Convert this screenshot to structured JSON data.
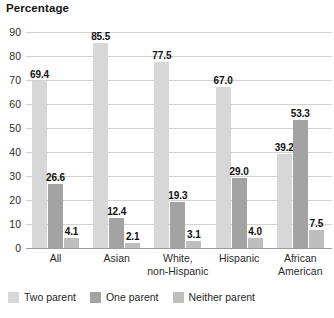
{
  "chart_data": {
    "type": "bar",
    "title": "Percentage",
    "xlabel": "",
    "ylabel": "Percentage",
    "ylim": [
      0,
      90
    ],
    "ytick_step": 10,
    "yticks": [
      90,
      80,
      70,
      60,
      50,
      40,
      30,
      20,
      10,
      0
    ],
    "grid": true,
    "legend_position": "bottom-left",
    "categories": [
      "All",
      "Asian",
      "White,\nnon-Hispanic",
      "Hispanic",
      "African\nAmerican"
    ],
    "series": [
      {
        "name": "Two parent",
        "color": "#d7d7d7",
        "values": [
          69.4,
          85.5,
          77.5,
          67.0,
          39.2
        ],
        "labels": [
          "69.4",
          "85.5",
          "77.5",
          "67.0",
          "39.2"
        ]
      },
      {
        "name": "One parent",
        "color": "#a3a3a3",
        "values": [
          26.6,
          12.4,
          19.3,
          29.0,
          53.3
        ],
        "labels": [
          "26.6",
          "12.4",
          "19.3",
          "29.0",
          "53.3"
        ]
      },
      {
        "name": "Neither parent",
        "color": "#bebebe",
        "values": [
          4.1,
          2.1,
          3.1,
          4.0,
          7.5
        ],
        "labels": [
          "4.1",
          "2.1",
          "3.1",
          "4.0",
          "7.5"
        ]
      }
    ]
  },
  "axis": {
    "ytick_labels": [
      "90",
      "80",
      "70",
      "60",
      "50",
      "40",
      "30",
      "20",
      "10",
      "0"
    ],
    "category_labels": [
      [
        "All"
      ],
      [
        "Asian"
      ],
      [
        "White,",
        "non-Hispanic"
      ],
      [
        "Hispanic"
      ],
      [
        "African",
        "American"
      ]
    ]
  },
  "legend": {
    "items": [
      {
        "label": "Two parent",
        "color": "#d7d7d7"
      },
      {
        "label": "One parent",
        "color": "#a3a3a3"
      },
      {
        "label": "Neither parent",
        "color": "#bebebe"
      }
    ]
  },
  "colors": {
    "background": "#ffffff",
    "gridline": "#d2d2d2",
    "baseline": "#9c9c9c",
    "text": "#1a1a1a"
  }
}
